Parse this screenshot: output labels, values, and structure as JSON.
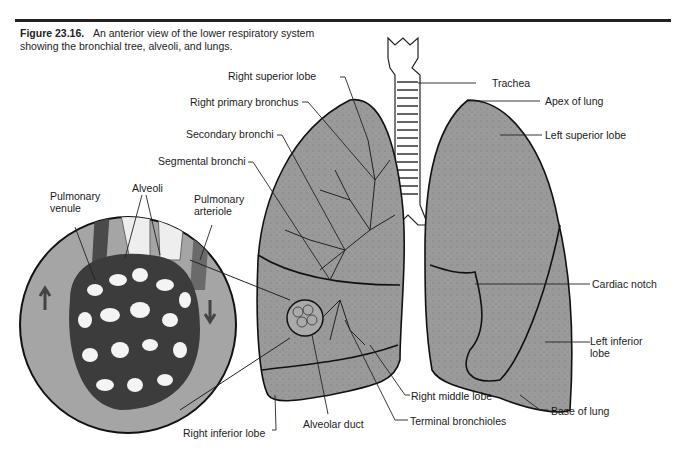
{
  "figure": {
    "number": "Figure 23.16.",
    "caption": "An anterior view of the lower respiratory system showing the bronchial tree, alveoli, and lungs."
  },
  "labels": {
    "right_superior_lobe": "Right superior lobe",
    "right_primary_bronchus": "Right primary bronchus",
    "secondary_bronchi": "Secondary bronchi",
    "segmental_bronchi": "Segmental bronchi",
    "pulmonary_venule": "Pulmonary venule",
    "alveoli": "Alveoli",
    "pulmonary_arteriole": "Pulmonary arteriole",
    "trachea": "Trachea",
    "apex_of_lung": "Apex of lung",
    "left_superior_lobe": "Left superior lobe",
    "cardiac_notch": "Cardiac notch",
    "left_inferior_lobe": "Left inferior lobe",
    "right_middle_lobe": "Right middle lobe",
    "terminal_bronchioles": "Terminal bronchioles",
    "base_of_lung": "Base of lung",
    "alveolar_duct": "Alveolar duct",
    "right_inferior_lobe": "Right inferior lobe"
  },
  "colors": {
    "lung_fill": "#9a9a9a",
    "dark_vessel": "#4a4a4a",
    "line": "#1a1a1a"
  }
}
